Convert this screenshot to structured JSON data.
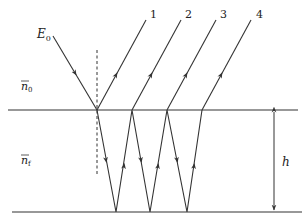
{
  "diagram": {
    "labels": {
      "incident": "E",
      "incident_sub": "0",
      "medium_top": "n",
      "medium_top_sub": "0",
      "medium_film": "n",
      "medium_film_sub": "f",
      "thickness": "h"
    },
    "rays": [
      {
        "label": "1"
      },
      {
        "label": "2"
      },
      {
        "label": "3"
      },
      {
        "label": "4"
      }
    ],
    "colors": {
      "line": "#333333",
      "background": "#ffffff"
    }
  }
}
